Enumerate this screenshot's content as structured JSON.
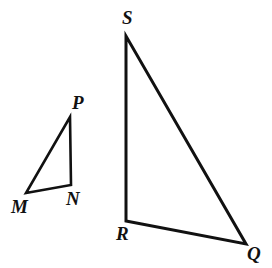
{
  "figure": {
    "type": "geometry-diagram",
    "background_color": "#ffffff",
    "stroke_color": "#111111",
    "label_color": "#111111",
    "canvas": {
      "width": 272,
      "height": 268
    },
    "shapes": [
      {
        "name": "triangle-MNP",
        "kind": "triangle",
        "stroke_width": 2.6,
        "vertices": [
          {
            "label": "M",
            "x": 26,
            "y": 193
          },
          {
            "label": "N",
            "x": 71,
            "y": 185
          },
          {
            "label": "P",
            "x": 70,
            "y": 117
          }
        ],
        "points_path": "26,193 71,185 70,117"
      },
      {
        "name": "triangle-QRS",
        "kind": "triangle",
        "stroke_width": 3.0,
        "vertices": [
          {
            "label": "R",
            "x": 126,
            "y": 221
          },
          {
            "label": "Q",
            "x": 246,
            "y": 244
          },
          {
            "label": "S",
            "x": 126,
            "y": 36
          }
        ],
        "points_path": "126,221 246,244 126,36"
      }
    ],
    "labels": [
      {
        "name": "vertex-label-P",
        "text": "P",
        "x": 72,
        "y": 93,
        "font_size": 19
      },
      {
        "name": "vertex-label-M",
        "text": "M",
        "x": 11,
        "y": 197,
        "font_size": 19
      },
      {
        "name": "vertex-label-N",
        "text": "N",
        "x": 66,
        "y": 189,
        "font_size": 19
      },
      {
        "name": "vertex-label-S",
        "text": "S",
        "x": 122,
        "y": 8,
        "font_size": 19
      },
      {
        "name": "vertex-label-R",
        "text": "R",
        "x": 116,
        "y": 224,
        "font_size": 19
      },
      {
        "name": "vertex-label-Q",
        "text": "Q",
        "x": 247,
        "y": 244,
        "font_size": 19
      }
    ]
  }
}
